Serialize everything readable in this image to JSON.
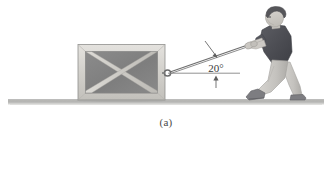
{
  "figure": {
    "caption": "(a)",
    "background_color": "#ffffff",
    "type": "physics-free-body-illustration",
    "description_labels": {
      "angle_label": "20°"
    }
  },
  "annotations": {
    "angle_value": "20°",
    "angle_degrees": 20,
    "reference_line": "horizontal",
    "arrow_count": 2
  },
  "objects": {
    "crate": {
      "name": "crate",
      "frame_color": "#d8d6d2",
      "panel_color": "#828282",
      "brace_color": "#d0cec9",
      "outline_color": "#8a8a8a"
    },
    "ground": {
      "name": "ground-surface",
      "color": "#b9b9b7",
      "shadow_color": "#9a9a98"
    },
    "person": {
      "name": "person-pulling-rope",
      "hair_color": "#5a5a5c",
      "skin_color": "#ccc9c4",
      "shirt_color": "#4e4f55",
      "pants_color": "#c9c7c3",
      "shoe_color": "#76767a"
    },
    "rope": {
      "name": "rope",
      "color": "#6e6e6e"
    }
  }
}
